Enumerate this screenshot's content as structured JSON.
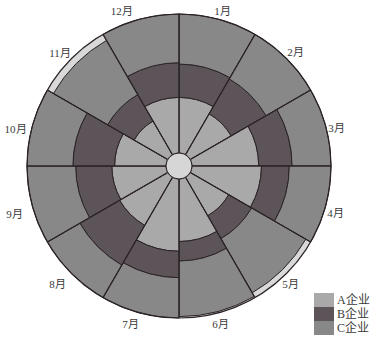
{
  "chart_data": {
    "type": "bar",
    "orientation": "radial",
    "stacked": true,
    "title": "",
    "xlabel": "",
    "ylabel": "",
    "ylim": [
      0,
      100
    ],
    "grid": false,
    "legend_position": "bottom-right",
    "start_angle": 0,
    "direction": "clockwise",
    "categories": [
      "1月",
      "2月",
      "3月",
      "4月",
      "5月",
      "6月",
      "7月",
      "8月",
      "9月",
      "10月",
      "11月",
      "12月"
    ],
    "series": [
      {
        "name": "A企业",
        "color": "#a9a9a9",
        "values": [
          40,
          34,
          48,
          50,
          32,
          45,
          52,
          40,
          39,
          37,
          28,
          40
        ]
      },
      {
        "name": "B企业",
        "color": "#5c5458",
        "values": [
          24,
          29,
          24,
          20,
          19,
          14,
          19,
          33,
          26,
          30,
          22,
          25
        ]
      },
      {
        "name": "C企业",
        "color": "#888888",
        "values": [
          36,
          37,
          28,
          30,
          45,
          40,
          29,
          27,
          35,
          33,
          45,
          35
        ]
      }
    ],
    "background_color": "#d9d9d9",
    "line_color": "#2b2326"
  },
  "legend": {
    "items": [
      {
        "label": "A企业",
        "color": "#a9a9a9"
      },
      {
        "label": "B企业",
        "color": "#5c5458"
      },
      {
        "label": "C企业",
        "color": "#888888"
      }
    ]
  }
}
